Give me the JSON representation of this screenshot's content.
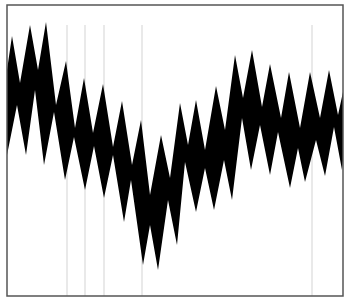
{
  "chart_data": {
    "type": "area",
    "title": "",
    "xlabel": "",
    "ylabel": "",
    "grid": false,
    "legend": null,
    "colors": {
      "fill": "#000000",
      "frame": "#555555",
      "background": "#ffffff",
      "scan_lines": "#c8c8c8"
    },
    "frame": {
      "x0": 7,
      "y0": 5,
      "x1": 343,
      "y1": 296
    },
    "upper_envelope": [
      [
        7,
        70
      ],
      [
        12,
        36
      ],
      [
        20,
        83
      ],
      [
        30,
        25
      ],
      [
        38,
        70
      ],
      [
        46,
        22
      ],
      [
        56,
        105
      ],
      [
        66,
        61
      ],
      [
        75,
        128
      ],
      [
        84,
        78
      ],
      [
        93,
        133
      ],
      [
        103,
        84
      ],
      [
        113,
        147
      ],
      [
        122,
        101
      ],
      [
        132,
        165
      ],
      [
        141,
        120
      ],
      [
        150,
        195
      ],
      [
        161,
        135
      ],
      [
        170,
        178
      ],
      [
        180,
        103
      ],
      [
        188,
        145
      ],
      [
        196,
        100
      ],
      [
        205,
        150
      ],
      [
        216,
        86
      ],
      [
        225,
        130
      ],
      [
        235,
        55
      ],
      [
        243,
        98
      ],
      [
        252,
        50
      ],
      [
        262,
        107
      ],
      [
        270,
        64
      ],
      [
        281,
        118
      ],
      [
        289,
        72
      ],
      [
        300,
        128
      ],
      [
        310,
        72
      ],
      [
        320,
        118
      ],
      [
        329,
        70
      ],
      [
        338,
        115
      ],
      [
        343,
        92
      ]
    ],
    "lower_envelope": [
      [
        7,
        155
      ],
      [
        17,
        105
      ],
      [
        26,
        155
      ],
      [
        35,
        90
      ],
      [
        44,
        165
      ],
      [
        54,
        112
      ],
      [
        65,
        180
      ],
      [
        74,
        137
      ],
      [
        85,
        190
      ],
      [
        94,
        146
      ],
      [
        104,
        198
      ],
      [
        113,
        155
      ],
      [
        124,
        222
      ],
      [
        131,
        180
      ],
      [
        143,
        265
      ],
      [
        150,
        225
      ],
      [
        158,
        270
      ],
      [
        168,
        200
      ],
      [
        177,
        245
      ],
      [
        185,
        162
      ],
      [
        196,
        212
      ],
      [
        205,
        168
      ],
      [
        214,
        210
      ],
      [
        224,
        160
      ],
      [
        232,
        200
      ],
      [
        242,
        118
      ],
      [
        251,
        170
      ],
      [
        260,
        125
      ],
      [
        270,
        175
      ],
      [
        278,
        132
      ],
      [
        290,
        188
      ],
      [
        298,
        148
      ],
      [
        305,
        182
      ],
      [
        316,
        140
      ],
      [
        325,
        176
      ],
      [
        334,
        127
      ],
      [
        342,
        170
      ],
      [
        343,
        160
      ]
    ],
    "scan_lines_x": [
      67,
      85,
      104,
      142,
      312
    ]
  }
}
